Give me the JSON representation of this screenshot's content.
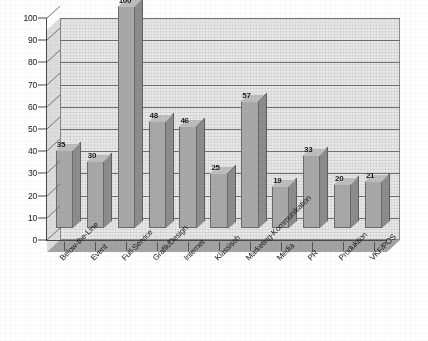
{
  "chart_data": {
    "type": "bar",
    "title": "",
    "subtitle": "",
    "xlabel": "",
    "ylabel": "",
    "ylim": [
      0,
      100
    ],
    "ytick_step": 10,
    "grid": true,
    "legend": false,
    "style": "3d-column-grayscale",
    "categories": [
      "Below-the-Line",
      "Event",
      "Full-Service",
      "Grafik/Design",
      "Internet",
      "Klassisch",
      "Marketing-Kommunikation",
      "Media",
      "PR",
      "Produktion",
      "VKF/POS"
    ],
    "values": [
      35,
      30,
      100,
      48,
      46,
      25,
      57,
      19,
      33,
      20,
      21
    ],
    "ytick_labels": [
      "0",
      "10",
      "20",
      "30",
      "40",
      "50",
      "60",
      "70",
      "80",
      "90",
      "100"
    ],
    "data_labels": [
      "35",
      "30",
      "100",
      "48",
      "46",
      "25",
      "57",
      "19",
      "33",
      "20",
      "21"
    ],
    "colors": {
      "bar_front": "#a8a8a8",
      "bar_side": "#8c8c8c",
      "bar_top": "#bdbdbd",
      "plot_background": "#e9e9e9",
      "floor": "#a3a3a3",
      "gridline": "#6f6f6f",
      "axis": "#4a4a4a",
      "text": "#1a1a1a",
      "page_background": "#ffffff"
    }
  }
}
